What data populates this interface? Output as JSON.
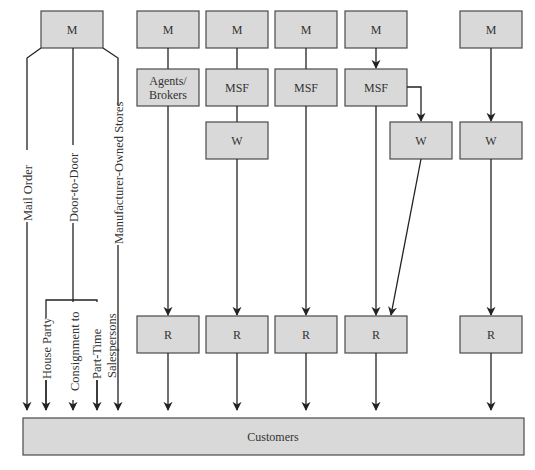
{
  "diagram": {
    "colors": {
      "box_fill": "#d9d9d9",
      "box_stroke": "#4a4a4a",
      "line": "#222222",
      "text": "#333333"
    },
    "boxes": {
      "m1": "M",
      "m2": "M",
      "m3": "M",
      "m4": "M",
      "m5": "M",
      "m6": "M",
      "agents_line1": "Agents/",
      "agents_line2": "Brokers",
      "msf3": "MSF",
      "msf4": "MSF",
      "msf5": "MSF",
      "w3": "W",
      "w5": "W",
      "w6": "W",
      "r2": "R",
      "r3": "R",
      "r4": "R",
      "r5": "R",
      "r6": "R",
      "customers": "Customers"
    },
    "direct_channels": {
      "mail_order": "Mail Order",
      "door_to_door": "Door-to-Door",
      "manufacturer_owned_stores": "Manufacturer-Owned Stores",
      "house_party": "House Party",
      "consignment_line1": "Consignment to",
      "consignment_line2": "Part-Time",
      "consignment_line3": "Salespersons"
    },
    "legend_meaning": {
      "M": "Manufacturer",
      "MSF": "Manufacturer's Sales Force",
      "W": "Wholesaler",
      "R": "Retailer"
    }
  }
}
